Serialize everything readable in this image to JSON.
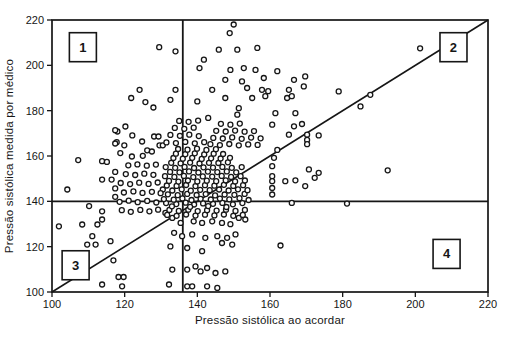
{
  "colors": {
    "ink": "#161616",
    "paper": "#ffffff",
    "point_fill": "#fcfcfc"
  },
  "chart_data": {
    "type": "scatter",
    "title": "",
    "xlabel": "Pressão sistólica ao acordar",
    "ylabel": "Pressão sistólica medida por médico",
    "xlim": [
      100,
      220
    ],
    "ylim": [
      100,
      220
    ],
    "xticks": [
      100,
      120,
      140,
      160,
      180,
      200,
      220
    ],
    "yticks": [
      100,
      120,
      140,
      160,
      180,
      200,
      220
    ],
    "grid": false,
    "reference_lines": {
      "vertical_x": 136,
      "horizontal_y": 140,
      "identity_line": {
        "from": [
          100,
          100
        ],
        "to": [
          220,
          220
        ]
      }
    },
    "quadrant_labels": [
      {
        "label": "1",
        "x": 108.5,
        "y": 208.0
      },
      {
        "label": "2",
        "x": 210.5,
        "y": 208.0
      },
      {
        "label": "3",
        "x": 106.5,
        "y": 111.8
      },
      {
        "label": "4",
        "x": 208.6,
        "y": 116.8
      }
    ],
    "points": [
      [
        129.5,
        208
      ],
      [
        150,
        218
      ],
      [
        148.9,
        214.2
      ],
      [
        145.9,
        206.9
      ],
      [
        151,
        206.9
      ],
      [
        156.5,
        207.7
      ],
      [
        134,
        206.2
      ],
      [
        141.8,
        202.5
      ],
      [
        201.3,
        207.5
      ],
      [
        140.6,
        198.8
      ],
      [
        149.1,
        198
      ],
      [
        152.8,
        198.8
      ],
      [
        156,
        198
      ],
      [
        158.3,
        194.4
      ],
      [
        147.7,
        193.6
      ],
      [
        152.3,
        192.9
      ],
      [
        157.8,
        189.2
      ],
      [
        153.7,
        190
      ],
      [
        144.1,
        189.2
      ],
      [
        134,
        189.2
      ],
      [
        132.6,
        184.8
      ],
      [
        140,
        184.1
      ],
      [
        147.7,
        185.6
      ],
      [
        151.4,
        181.1
      ],
      [
        155.1,
        185.6
      ],
      [
        158.7,
        186.4
      ],
      [
        159.5,
        188.6
      ],
      [
        151,
        178.2
      ],
      [
        124.1,
        189.2
      ],
      [
        121.8,
        185.6
      ],
      [
        125.7,
        183.8
      ],
      [
        127.9,
        181.4
      ],
      [
        120.2,
        173
      ],
      [
        118,
        170.8
      ],
      [
        122.1,
        169.1
      ],
      [
        117.8,
        166.1
      ],
      [
        119.9,
        164.7
      ],
      [
        124.8,
        166.4
      ],
      [
        128.1,
        168.6
      ],
      [
        129.3,
        168.6
      ],
      [
        129.6,
        164.7
      ],
      [
        130.5,
        164.7
      ],
      [
        126.2,
        162.5
      ],
      [
        127.5,
        162
      ],
      [
        118.8,
        161.3
      ],
      [
        107.2,
        158.2
      ],
      [
        113.8,
        157.7
      ],
      [
        162,
        197.4
      ],
      [
        166.6,
        193.6
      ],
      [
        169.7,
        195.1
      ],
      [
        169.3,
        190.7
      ],
      [
        165.2,
        189.2
      ],
      [
        164.7,
        185.6
      ],
      [
        166,
        186.4
      ],
      [
        178.9,
        188.5
      ],
      [
        184.9,
        181.9
      ],
      [
        187.6,
        187
      ],
      [
        161.5,
        178.9
      ],
      [
        167,
        178.9
      ],
      [
        160.6,
        173.8
      ],
      [
        166.6,
        173.1
      ],
      [
        168.8,
        174.1
      ],
      [
        165.2,
        169.4
      ],
      [
        170.2,
        169.4
      ],
      [
        173.4,
        169.1
      ],
      [
        170.2,
        167.1
      ],
      [
        170.2,
        165.2
      ],
      [
        162,
        162.7
      ],
      [
        161.1,
        159.2
      ],
      [
        160.6,
        155.5
      ],
      [
        170.7,
        154.1
      ],
      [
        173.4,
        152.6
      ],
      [
        164.2,
        148.9
      ],
      [
        167,
        149.3
      ],
      [
        172.3,
        150.4
      ],
      [
        169.7,
        146.7
      ],
      [
        160.6,
        151.1
      ],
      [
        160.6,
        148.9
      ],
      [
        160.6,
        145.9
      ],
      [
        160.6,
        143
      ],
      [
        166,
        139.3
      ],
      [
        181.2,
        139
      ],
      [
        162.9,
        120.5
      ],
      [
        192.4,
        153.7
      ],
      [
        104.2,
        145.2
      ],
      [
        113.8,
        149.6
      ],
      [
        116.4,
        149.6
      ],
      [
        110.2,
        137.9
      ],
      [
        113.8,
        135.6
      ],
      [
        101.9,
        129
      ],
      [
        108.3,
        129.8
      ],
      [
        112.5,
        129.8
      ],
      [
        113.8,
        132
      ],
      [
        111.1,
        124.6
      ],
      [
        109.7,
        120.9
      ],
      [
        112,
        120.9
      ],
      [
        116.1,
        122.4
      ],
      [
        113.8,
        103.3
      ],
      [
        117.4,
        171.4
      ],
      [
        117.4,
        165.5
      ],
      [
        115.1,
        157.4
      ],
      [
        117.4,
        153
      ],
      [
        117.4,
        145.7
      ],
      [
        117.4,
        142
      ],
      [
        131.2,
        134.9
      ],
      [
        133.1,
        132.7
      ],
      [
        135.4,
        130.5
      ],
      [
        139,
        131.2
      ],
      [
        141.3,
        130.5
      ],
      [
        144.1,
        131.2
      ],
      [
        146.8,
        130.5
      ],
      [
        149.1,
        129.9
      ],
      [
        151.4,
        132.7
      ],
      [
        153.2,
        132
      ],
      [
        133.6,
        126.1
      ],
      [
        135.8,
        124.6
      ],
      [
        138.6,
        125.4
      ],
      [
        142.2,
        123.9
      ],
      [
        145.5,
        124.6
      ],
      [
        148.2,
        123.9
      ],
      [
        150.5,
        125.4
      ],
      [
        132.6,
        120.1
      ],
      [
        137.2,
        119.4
      ],
      [
        141.3,
        118
      ],
      [
        146.8,
        121.6
      ],
      [
        149.6,
        120.9
      ],
      [
        139.5,
        111.3
      ],
      [
        142.7,
        110.6
      ],
      [
        133.1,
        109.9
      ],
      [
        137.2,
        109.9
      ],
      [
        140.9,
        109.1
      ],
      [
        145,
        108.4
      ],
      [
        147.7,
        109.1
      ],
      [
        132.2,
        103.3
      ],
      [
        137.2,
        102.5
      ],
      [
        138.6,
        102.5
      ],
      [
        142.7,
        102.5
      ],
      [
        145.5,
        101.8
      ],
      [
        119.3,
        102.5
      ],
      [
        116.9,
        114
      ],
      [
        118.3,
        106.6
      ],
      [
        119.7,
        106.6
      ],
      [
        131.4,
        139.2
      ],
      [
        134.2,
        138.8
      ],
      [
        136.8,
        139.4
      ],
      [
        139.1,
        138.6
      ],
      [
        141.6,
        139.1
      ],
      [
        144.3,
        138.9
      ],
      [
        146.9,
        139.3
      ],
      [
        149.8,
        138.7
      ],
      [
        152.4,
        139.2
      ],
      [
        130.8,
        141
      ],
      [
        133.5,
        140.7
      ],
      [
        135.9,
        141.3
      ],
      [
        138.4,
        140.6
      ],
      [
        140.9,
        141.1
      ],
      [
        143.7,
        140.8
      ],
      [
        146.2,
        141.2
      ],
      [
        148.8,
        140.9
      ],
      [
        151.6,
        141.4
      ],
      [
        154.1,
        140.6
      ],
      [
        131.9,
        143.1
      ],
      [
        134.6,
        142.7
      ],
      [
        137.2,
        143.3
      ],
      [
        139.8,
        142.8
      ],
      [
        142.3,
        143.2
      ],
      [
        144.9,
        142.6
      ],
      [
        147.5,
        143
      ],
      [
        150.2,
        142.9
      ],
      [
        153,
        143.3
      ],
      [
        130.5,
        145.2
      ],
      [
        133.1,
        144.8
      ],
      [
        135.7,
        145.3
      ],
      [
        138.2,
        144.7
      ],
      [
        140.8,
        145.1
      ],
      [
        143.4,
        144.9
      ],
      [
        146,
        145.2
      ],
      [
        148.6,
        144.8
      ],
      [
        151.2,
        145.3
      ],
      [
        153.8,
        144.9
      ],
      [
        131.6,
        147
      ],
      [
        134.3,
        146.8
      ],
      [
        136.9,
        147.2
      ],
      [
        139.5,
        146.7
      ],
      [
        142.1,
        147.1
      ],
      [
        144.7,
        146.9
      ],
      [
        147.3,
        147.3
      ],
      [
        149.9,
        146.8
      ],
      [
        152.6,
        147.1
      ],
      [
        132.2,
        149
      ],
      [
        134.8,
        148.7
      ],
      [
        137.4,
        149.2
      ],
      [
        140,
        148.8
      ],
      [
        142.6,
        149.1
      ],
      [
        145.2,
        148.9
      ],
      [
        147.8,
        149.3
      ],
      [
        150.4,
        148.8
      ],
      [
        153.1,
        149.2
      ],
      [
        131.1,
        151.1
      ],
      [
        133.7,
        150.8
      ],
      [
        136.3,
        151.2
      ],
      [
        138.9,
        150.7
      ],
      [
        141.5,
        151
      ],
      [
        144.1,
        150.9
      ],
      [
        146.7,
        151.2
      ],
      [
        149.3,
        150.8
      ],
      [
        151.9,
        151.1
      ],
      [
        132.5,
        153
      ],
      [
        135.1,
        152.8
      ],
      [
        137.7,
        153.2
      ],
      [
        140.3,
        152.7
      ],
      [
        142.9,
        153.1
      ],
      [
        145.5,
        152.9
      ],
      [
        148.1,
        153.2
      ],
      [
        150.7,
        152.8
      ],
      [
        131.3,
        155.1
      ],
      [
        133.9,
        154.8
      ],
      [
        136.5,
        155.2
      ],
      [
        139.1,
        154.7
      ],
      [
        141.7,
        155
      ],
      [
        144.3,
        154.9
      ],
      [
        146.9,
        155.2
      ],
      [
        149.5,
        154.8
      ],
      [
        152.2,
        155.1
      ],
      [
        132.8,
        157
      ],
      [
        135.4,
        156.8
      ],
      [
        138,
        157.1
      ],
      [
        140.6,
        156.7
      ],
      [
        143.2,
        157
      ],
      [
        145.8,
        156.9
      ],
      [
        148.4,
        157.2
      ],
      [
        133.4,
        159.1
      ],
      [
        136,
        158.8
      ],
      [
        138.6,
        159.2
      ],
      [
        141.2,
        158.7
      ],
      [
        143.8,
        159
      ],
      [
        146.4,
        158.9
      ],
      [
        149,
        159.2
      ],
      [
        134.1,
        161
      ],
      [
        136.7,
        160.8
      ],
      [
        139.3,
        161.2
      ],
      [
        141.9,
        160.7
      ],
      [
        144.5,
        161
      ],
      [
        147.1,
        160.9
      ],
      [
        134.7,
        163.1
      ],
      [
        137.3,
        162.8
      ],
      [
        139.9,
        163.2
      ],
      [
        142.5,
        162.7
      ],
      [
        145.1,
        163
      ],
      [
        119.2,
        136.1
      ],
      [
        121.7,
        135.4
      ],
      [
        124.3,
        136.2
      ],
      [
        126.8,
        135.6
      ],
      [
        129.2,
        136.3
      ],
      [
        118.6,
        139.8
      ],
      [
        121.1,
        140.3
      ],
      [
        123.6,
        139.6
      ],
      [
        126.2,
        140.2
      ],
      [
        128.7,
        139.5
      ],
      [
        119.8,
        143.9
      ],
      [
        122.4,
        144.4
      ],
      [
        124.9,
        143.7
      ],
      [
        127.5,
        144.2
      ],
      [
        129.9,
        143.6
      ],
      [
        118.9,
        148.1
      ],
      [
        121.5,
        147.6
      ],
      [
        124,
        148.2
      ],
      [
        126.6,
        147.7
      ],
      [
        129.1,
        148.3
      ],
      [
        120.3,
        152
      ],
      [
        122.9,
        151.6
      ],
      [
        125.4,
        152.2
      ],
      [
        127.9,
        151.7
      ],
      [
        121,
        155.9
      ],
      [
        123.5,
        156.3
      ],
      [
        126.1,
        155.7
      ],
      [
        128.6,
        156.2
      ],
      [
        122,
        159.8
      ],
      [
        125,
        160.1
      ],
      [
        131.7,
        134
      ],
      [
        134.3,
        133.6
      ],
      [
        136.9,
        134.2
      ],
      [
        139.5,
        133.7
      ],
      [
        142.1,
        134.1
      ],
      [
        144.7,
        133.8
      ],
      [
        147.3,
        134.2
      ],
      [
        149.9,
        133.6
      ],
      [
        152.5,
        134
      ],
      [
        132.3,
        136.2
      ],
      [
        134.9,
        135.8
      ],
      [
        137.5,
        136.3
      ],
      [
        140.1,
        135.7
      ],
      [
        142.7,
        136.1
      ],
      [
        145.3,
        135.9
      ],
      [
        147.9,
        136.3
      ],
      [
        150.5,
        135.8
      ],
      [
        153.1,
        136.2
      ],
      [
        133,
        137.8
      ],
      [
        138,
        137.6
      ],
      [
        143,
        137.9
      ],
      [
        148,
        137.5
      ],
      [
        143.6,
        165.2
      ],
      [
        146.2,
        164.8
      ],
      [
        148.8,
        165.3
      ],
      [
        151.4,
        164.7
      ],
      [
        154,
        165.1
      ],
      [
        156.6,
        164.9
      ],
      [
        144.4,
        168
      ],
      [
        147,
        167.7
      ],
      [
        149.6,
        168.2
      ],
      [
        152.2,
        167.6
      ],
      [
        154.8,
        168.1
      ],
      [
        157.4,
        167.8
      ],
      [
        145.2,
        171.1
      ],
      [
        147.8,
        170.8
      ],
      [
        150.4,
        171.2
      ],
      [
        153,
        170.7
      ],
      [
        155.6,
        171
      ],
      [
        146.5,
        174.2
      ],
      [
        149.1,
        173.8
      ],
      [
        151.7,
        174.3
      ],
      [
        131.5,
        166
      ],
      [
        134.1,
        165.7
      ],
      [
        136.7,
        166.2
      ],
      [
        139.3,
        165.6
      ],
      [
        141.9,
        166.1
      ],
      [
        132.6,
        169.3
      ],
      [
        135.2,
        168.9
      ],
      [
        137.8,
        169.4
      ],
      [
        140.4,
        168.8
      ],
      [
        133.8,
        172.4
      ],
      [
        136.4,
        172
      ],
      [
        139,
        172.5
      ],
      [
        135,
        175.5
      ],
      [
        137.6,
        175.1
      ],
      [
        140.2,
        175.6
      ],
      [
        143,
        176.8
      ]
    ]
  }
}
